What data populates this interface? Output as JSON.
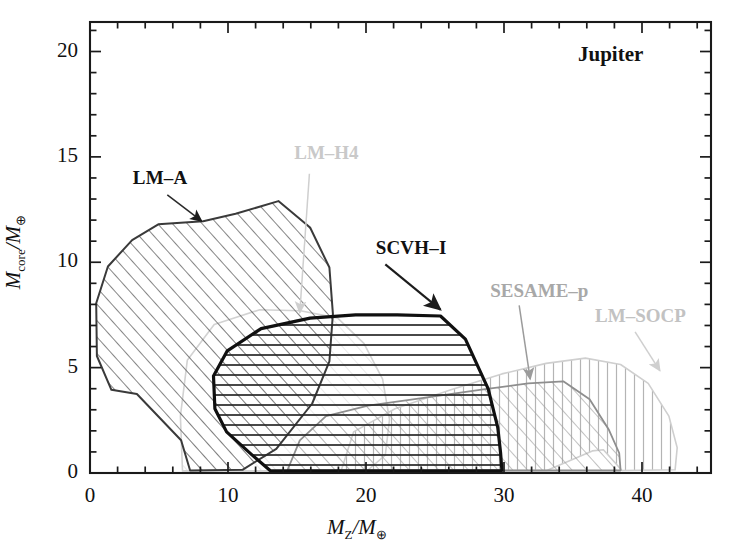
{
  "figure": {
    "corner_label": "Jupiter",
    "background": "#ffffff"
  },
  "chart_data": {
    "type": "area",
    "title": "Jupiter",
    "xlabel": "M_Z/M_⊕",
    "ylabel": "M_core/M_⊕",
    "xlabel_parts": {
      "main": "M",
      "sub": "Z",
      "denom": "M",
      "denom_sub": "⊕"
    },
    "ylabel_parts": {
      "main": "M",
      "sub": "core",
      "denom": "M",
      "denom_sub": "⊕"
    },
    "xlim": [
      0,
      45
    ],
    "ylim": [
      0,
      21.4
    ],
    "xticks": [
      0,
      10,
      20,
      30,
      40
    ],
    "xtick_labels": [
      "0",
      "10",
      "20",
      "30",
      "40"
    ],
    "yticks": [
      0,
      5,
      10,
      15,
      20
    ],
    "ytick_labels": [
      "0",
      "5",
      "10",
      "15",
      "20"
    ],
    "xminor_step": 2,
    "yminor_step": 1,
    "grid": false,
    "legend": "none",
    "series": [
      {
        "name": "LM-A",
        "label": "LM–A",
        "hatch": "diagonal-forward",
        "stroke": "#3a3a3a",
        "stroke_width": 2.0,
        "emphasis": "normal",
        "label_color": "#111111",
        "label_pos": [
          3.1,
          13.9
        ],
        "arrow_from": [
          5.6,
          13.2
        ],
        "arrow_to": [
          8.1,
          11.95
        ],
        "polygon": [
          [
            0.45,
            8.05
          ],
          [
            1.3,
            9.8
          ],
          [
            3.05,
            11.05
          ],
          [
            4.95,
            11.8
          ],
          [
            8.2,
            11.95
          ],
          [
            10.55,
            12.3
          ],
          [
            13.65,
            12.9
          ],
          [
            15.95,
            11.65
          ],
          [
            17.35,
            9.75
          ],
          [
            17.6,
            7.55
          ],
          [
            17.35,
            5.3
          ],
          [
            16.1,
            3.3
          ],
          [
            13.5,
            1.15
          ],
          [
            11.05,
            0.15
          ],
          [
            7.25,
            0.12
          ],
          [
            6.6,
            1.55
          ],
          [
            3.4,
            3.75
          ],
          [
            1.55,
            3.95
          ],
          [
            0.5,
            5.55
          ]
        ]
      },
      {
        "name": "LM-H4",
        "label": "LM–H4",
        "hatch": "diagonal-forward",
        "stroke": "#d2d2d2",
        "stroke_width": 1.6,
        "emphasis": "faded",
        "label_color": "#c9c9c9",
        "label_pos": [
          14.8,
          15.1
        ],
        "arrow_from": [
          15.9,
          14.2
        ],
        "arrow_to": [
          15.2,
          7.6
        ],
        "polygon": [
          [
            6.7,
            0.1
          ],
          [
            6.55,
            2.7
          ],
          [
            7.05,
            5.35
          ],
          [
            9.0,
            7.05
          ],
          [
            12.3,
            7.75
          ],
          [
            15.25,
            7.7
          ],
          [
            17.95,
            7.35
          ],
          [
            19.85,
            6.15
          ],
          [
            21.2,
            4.45
          ],
          [
            21.7,
            2.55
          ],
          [
            21.4,
            0.85
          ],
          [
            20.1,
            0.12
          ],
          [
            13.1,
            0.1
          ]
        ]
      },
      {
        "name": "SCVH-I",
        "label": "SCVH–I",
        "hatch": "horizontal",
        "stroke": "#101010",
        "stroke_width": 3.2,
        "emphasis": "bold",
        "label_color": "#111111",
        "label_pos": [
          20.7,
          10.6
        ],
        "arrow_from": [
          21.4,
          9.9
        ],
        "arrow_to": [
          25.4,
          7.75
        ],
        "polygon": [
          [
            9.05,
            3.05
          ],
          [
            8.95,
            4.6
          ],
          [
            9.95,
            5.8
          ],
          [
            12.4,
            6.85
          ],
          [
            15.95,
            7.35
          ],
          [
            19.25,
            7.5
          ],
          [
            22.25,
            7.5
          ],
          [
            25.4,
            7.45
          ],
          [
            27.2,
            6.35
          ],
          [
            28.85,
            4.0
          ],
          [
            29.55,
            2.15
          ],
          [
            29.75,
            0.95
          ],
          [
            29.85,
            0.12
          ],
          [
            16.05,
            0.1
          ],
          [
            13.05,
            0.12
          ],
          [
            11.75,
            0.85
          ],
          [
            9.9,
            1.95
          ]
        ]
      },
      {
        "name": "SESAME-p",
        "label": "SESAME–p",
        "hatch": "diagonal-forward",
        "stroke": "#8e8e8e",
        "stroke_width": 1.8,
        "emphasis": "gray",
        "label_color": "#a8a8a8",
        "label_pos": [
          29.0,
          8.55
        ],
        "arrow_from": [
          31.1,
          7.95
        ],
        "arrow_to": [
          31.9,
          4.45
        ],
        "polygon": [
          [
            14.3,
            0.12
          ],
          [
            15.2,
            1.55
          ],
          [
            17.1,
            2.7
          ],
          [
            20.15,
            3.2
          ],
          [
            24.05,
            3.55
          ],
          [
            28.25,
            3.95
          ],
          [
            31.75,
            4.25
          ],
          [
            34.3,
            4.35
          ],
          [
            36.2,
            3.5
          ],
          [
            37.6,
            2.05
          ],
          [
            38.35,
            0.95
          ],
          [
            38.45,
            0.12
          ]
        ]
      },
      {
        "name": "LM-SOCP",
        "label": "LM–SOCP",
        "hatch": "vertical",
        "stroke": "#cfcfcf",
        "stroke_width": 1.6,
        "emphasis": "faded",
        "label_color": "#c2c2c2",
        "label_pos": [
          36.6,
          7.35
        ],
        "arrow_from": [
          39.5,
          6.7
        ],
        "arrow_to": [
          41.3,
          4.85
        ],
        "polygon": [
          [
            18.2,
            0.12
          ],
          [
            19.1,
            1.95
          ],
          [
            22.1,
            3.05
          ],
          [
            26.15,
            3.95
          ],
          [
            29.85,
            4.7
          ],
          [
            33.05,
            5.2
          ],
          [
            35.9,
            5.45
          ],
          [
            38.45,
            5.15
          ],
          [
            40.45,
            4.25
          ],
          [
            41.95,
            2.7
          ],
          [
            42.55,
            1.2
          ],
          [
            42.4,
            0.15
          ],
          [
            38.55,
            0.12
          ],
          [
            37.2,
            1.1
          ],
          [
            36.4,
            1.05
          ],
          [
            33.1,
            0.12
          ]
        ]
      }
    ]
  }
}
